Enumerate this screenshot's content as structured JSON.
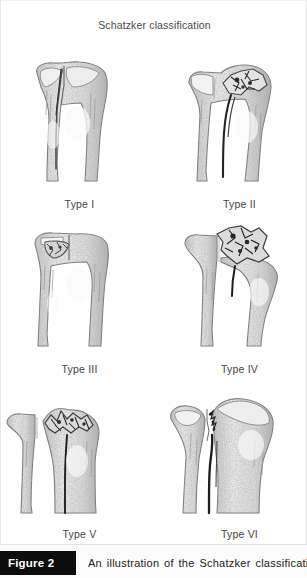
{
  "figure": {
    "title": "Schatzker classification",
    "caption_badge": "Figure 2",
    "caption_text": "An illustration of the Schatzker classification sys-"
  },
  "colors": {
    "badge_background": "#0d0d0d",
    "badge_text": "#ffffff",
    "panel_background": "#ffffff",
    "title_text": "#4a4a4a",
    "label_text": "#454545",
    "illustration_ink": "#6e6e6e"
  },
  "illustrations": [
    {
      "label": "Type I",
      "subject": "proximal-tibia-lateral-split-fracture"
    },
    {
      "label": "Type II",
      "subject": "proximal-tibia-split-depression-fracture"
    },
    {
      "label": "Type III",
      "subject": "proximal-tibia-pure-depression-fracture"
    },
    {
      "label": "Type IV",
      "subject": "proximal-tibia-medial-plateau-fracture"
    },
    {
      "label": "Type V",
      "subject": "proximal-tibia-bicondylar-fracture"
    },
    {
      "label": "Type VI",
      "subject": "proximal-tibia-metaphyseal-diaphyseal-dissociation"
    }
  ]
}
